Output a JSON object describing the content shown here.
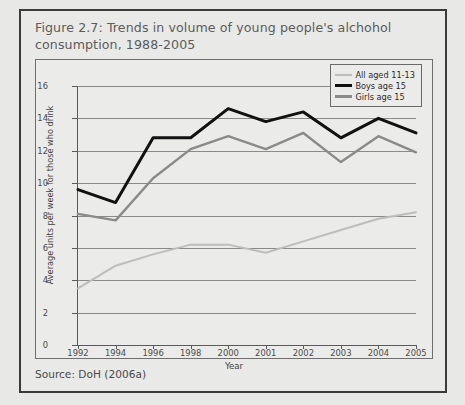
{
  "figure": {
    "title": "Figure 2.7: Trends in volume of young people's alchohol consumption, 1988-2005",
    "source": "Source: DoH (2006a)"
  },
  "chart_data": {
    "type": "line",
    "title": "Figure 2.7: Trends in volume of young people's alchohol consumption, 1988-2005",
    "xlabel": "Year",
    "ylabel": "Average units per week for those who drink",
    "categories": [
      "1992",
      "1994",
      "1996",
      "1998",
      "2000",
      "2001",
      "2002",
      "2003",
      "2004",
      "2005"
    ],
    "ylim": [
      0,
      16
    ],
    "yticks": [
      0,
      2,
      4,
      6,
      8,
      10,
      12,
      14,
      16
    ],
    "grid": true,
    "legend_position": "top-right",
    "series": [
      {
        "name": "All aged 11-13",
        "color": "#bdbdbd",
        "values": [
          3.5,
          4.9,
          5.6,
          6.2,
          6.2,
          5.7,
          6.4,
          7.1,
          7.8,
          8.2
        ]
      },
      {
        "name": "Boys age 15",
        "color": "#111111",
        "values": [
          9.6,
          8.8,
          12.8,
          12.8,
          14.6,
          13.8,
          14.4,
          12.8,
          14.0,
          13.1
        ]
      },
      {
        "name": "Girls age 15",
        "color": "#8a8a8a",
        "values": [
          8.1,
          7.7,
          10.3,
          12.1,
          12.9,
          12.1,
          13.1,
          11.3,
          12.9,
          11.9
        ]
      }
    ]
  },
  "axis": {
    "x_title": "Year",
    "y_title": "Average units per week for those who drink"
  }
}
